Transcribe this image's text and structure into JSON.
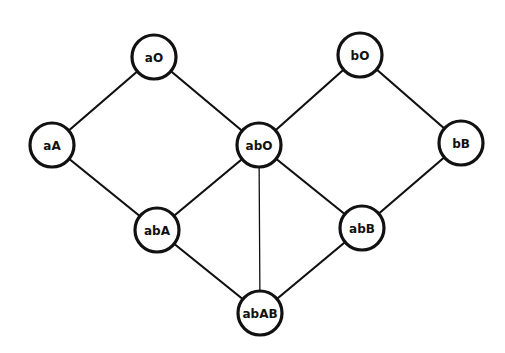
{
  "diagram": {
    "type": "graph",
    "radius": 22,
    "nodes": [
      {
        "id": "aO",
        "label": "aO",
        "x": 154,
        "y": 57
      },
      {
        "id": "bO",
        "label": "bO",
        "x": 360,
        "y": 55
      },
      {
        "id": "aA",
        "label": "aA",
        "x": 52,
        "y": 145
      },
      {
        "id": "abO",
        "label": "abO",
        "x": 259,
        "y": 145
      },
      {
        "id": "bB",
        "label": "bB",
        "x": 461,
        "y": 143
      },
      {
        "id": "abA",
        "label": "abA",
        "x": 157,
        "y": 230
      },
      {
        "id": "abB",
        "label": "abB",
        "x": 362,
        "y": 228
      },
      {
        "id": "abAB",
        "label": "abAB",
        "x": 260,
        "y": 313
      }
    ],
    "edges": [
      {
        "from": "aO",
        "to": "aA"
      },
      {
        "from": "aO",
        "to": "abO"
      },
      {
        "from": "bO",
        "to": "abO"
      },
      {
        "from": "bO",
        "to": "bB"
      },
      {
        "from": "aA",
        "to": "abA"
      },
      {
        "from": "abO",
        "to": "abA"
      },
      {
        "from": "abO",
        "to": "abB"
      },
      {
        "from": "abO",
        "to": "abAB",
        "thin": true
      },
      {
        "from": "bB",
        "to": "abB"
      },
      {
        "from": "abA",
        "to": "abAB"
      },
      {
        "from": "abB",
        "to": "abAB"
      }
    ]
  }
}
